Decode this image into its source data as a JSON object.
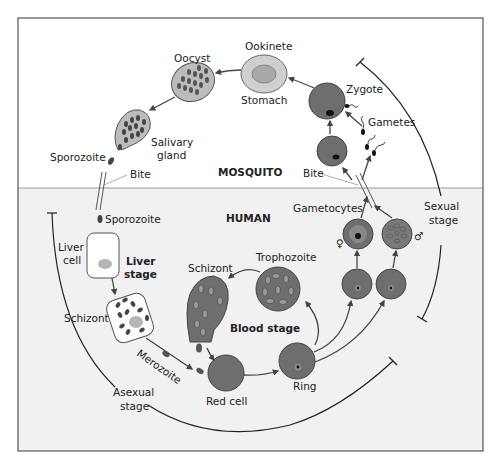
{
  "figure": {
    "regions": {
      "mosquito": "MOSQUITO",
      "human": "HUMAN"
    },
    "colors": {
      "frame": "#555555",
      "mosquito_bg": "#ffffff",
      "human_bg": "#f1f1f1",
      "cell_dark": "#6e6e6e",
      "cell_light": "#bdbdbd",
      "oocyst_fill": "#bcbcbc",
      "nucleus": "#111111",
      "arrow": "#444444"
    },
    "labels": {
      "oocyst": "Oocyst",
      "ookinete": "Ookinete",
      "stomach": "Stomach",
      "zygote": "Zygote",
      "gametes": "Gametes",
      "salivary_gland_1": "Salivary",
      "salivary_gland_2": "gland",
      "sporozoite_mosquito": "Sporozoite",
      "bite_left": "Bite",
      "bite_right": "Bite",
      "sporozoite_human": "Sporozoite",
      "liver_cell_1": "Liver",
      "liver_cell_2": "cell",
      "liver_stage_1": "Liver",
      "liver_stage_2": "stage",
      "schizont_liver": "Schizont",
      "merozoite": "Merozoite",
      "schizont_blood": "Schizont",
      "trophozoite": "Trophozoite",
      "blood_stage": "Blood stage",
      "red_cell": "Red cell",
      "ring": "Ring",
      "gametocytes": "Gametocytes",
      "female_symbol": "♀",
      "male_symbol": "♂",
      "sexual_stage_1": "Sexual",
      "sexual_stage_2": "stage",
      "asexual_stage_1": "Asexual",
      "asexual_stage_2": "stage"
    }
  }
}
